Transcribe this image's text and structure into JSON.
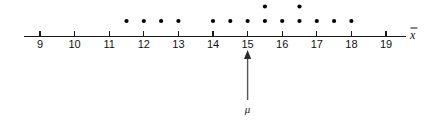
{
  "figure": {
    "axis_name": "x",
    "axis_name_accent": "bar",
    "parameter_label": "μ",
    "parameter_value": 15
  },
  "axis": {
    "tick_labels": [
      "9",
      "10",
      "11",
      "12",
      "13",
      "14",
      "15",
      "16",
      "17",
      "18",
      "19"
    ],
    "tick_values": [
      9,
      10,
      11,
      12,
      13,
      14,
      15,
      16,
      17,
      18,
      19
    ],
    "min": 9,
    "max": 19,
    "line_color": "#1a1a1a",
    "label_color": "#111111"
  },
  "chart_data": {
    "type": "scatter",
    "title": "",
    "subtitle": "",
    "xlabel": "x̄",
    "ylabel": "",
    "xlim": [
      8.6,
      19.6
    ],
    "grid": false,
    "legend": null,
    "plot_style": "dotplot",
    "dot_color": "#000000",
    "dot_radius": 2.1,
    "x": [
      11.5,
      12,
      12.5,
      13,
      14,
      14.5,
      15,
      15.5,
      16,
      16.5,
      17,
      17.5,
      18,
      15.5,
      16.5
    ],
    "stack_counts": [
      {
        "value": 11.5,
        "count": 1
      },
      {
        "value": 12,
        "count": 1
      },
      {
        "value": 12.5,
        "count": 1
      },
      {
        "value": 13,
        "count": 1
      },
      {
        "value": 14,
        "count": 1
      },
      {
        "value": 14.5,
        "count": 1
      },
      {
        "value": 15,
        "count": 1
      },
      {
        "value": 15.5,
        "count": 2
      },
      {
        "value": 16,
        "count": 1
      },
      {
        "value": 16.5,
        "count": 2
      },
      {
        "value": 17,
        "count": 1
      },
      {
        "value": 17.5,
        "count": 1
      },
      {
        "value": 18,
        "count": 1
      }
    ],
    "points": [
      {
        "x": 11.5,
        "row": 1
      },
      {
        "x": 12,
        "row": 1
      },
      {
        "x": 12.5,
        "row": 1
      },
      {
        "x": 13,
        "row": 1
      },
      {
        "x": 14,
        "row": 1
      },
      {
        "x": 14.5,
        "row": 1
      },
      {
        "x": 15,
        "row": 1
      },
      {
        "x": 15.5,
        "row": 1
      },
      {
        "x": 16,
        "row": 1
      },
      {
        "x": 16.5,
        "row": 1
      },
      {
        "x": 17,
        "row": 1
      },
      {
        "x": 17.5,
        "row": 1
      },
      {
        "x": 18,
        "row": 1
      },
      {
        "x": 15.5,
        "row": 2
      },
      {
        "x": 16.5,
        "row": 2
      }
    ],
    "annotations": [
      {
        "name": "mu-pointer",
        "label": "μ",
        "x": 15,
        "direction": "up"
      }
    ]
  }
}
